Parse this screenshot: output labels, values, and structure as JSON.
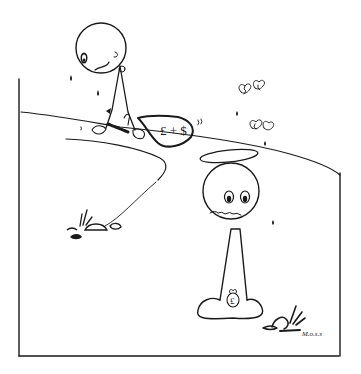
{
  "illustration": {
    "type": "hand-drawn cartoon",
    "bag_label": "£ + $",
    "money_bag_symbol": "£",
    "signature": "M.o.s.s",
    "colors": {
      "ink": "#1a1a1a",
      "background": "#ffffff"
    },
    "elements": [
      "crying-figure-with-money-bag",
      "haloed-smiling-figure",
      "broken-hearts",
      "tear-drops",
      "grass-and-rocks"
    ]
  }
}
